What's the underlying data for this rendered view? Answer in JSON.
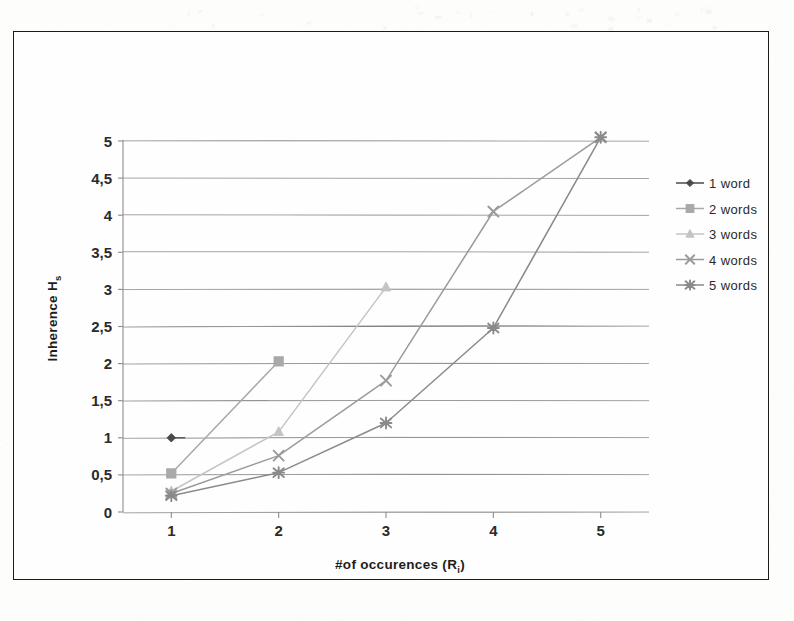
{
  "figure": {
    "frame_color": "#1a1a1a",
    "background": "#fefefe"
  },
  "chart_data": {
    "type": "line",
    "title": "",
    "subtitle": "",
    "xlabel": "#of occurences (R",
    "xlabel_sub": "i",
    "xlabel_suffix": ")",
    "ylabel": "Inherence H",
    "ylabel_sub": "s",
    "x": [
      1,
      2,
      3,
      4,
      5
    ],
    "xtick_labels": [
      "1",
      "2",
      "3",
      "4",
      "5"
    ],
    "ytick_labels": [
      "0",
      "0,5",
      "1",
      "1,5",
      "2",
      "2,5",
      "3",
      "3,5",
      "4",
      "4,5",
      "5"
    ],
    "ytick_values": [
      0,
      0.5,
      1,
      1.5,
      2,
      2.5,
      3,
      3.5,
      4,
      4.5,
      5
    ],
    "xlim": [
      0.55,
      5.45
    ],
    "ylim": [
      0,
      5
    ],
    "grid": true,
    "grid_axis": "y",
    "legend_position": "right",
    "decimal_separator": ",",
    "series": [
      {
        "name": "1 word",
        "marker": "diamond",
        "color": "#4a4a4a",
        "x": [
          1
        ],
        "values": [
          1.0
        ]
      },
      {
        "name": "2 words",
        "marker": "square",
        "color": "#a9a9a9",
        "x": [
          1,
          2
        ],
        "values": [
          0.52,
          2.03
        ]
      },
      {
        "name": "3 words",
        "marker": "triangle",
        "color": "#c4c4c4",
        "x": [
          1,
          2,
          3
        ],
        "values": [
          0.28,
          1.08,
          3.03
        ]
      },
      {
        "name": "4 words",
        "marker": "cross",
        "color": "#9b9b9b",
        "x": [
          1,
          2,
          3,
          4,
          5
        ],
        "values": [
          0.25,
          0.76,
          1.77,
          4.05,
          5.05
        ]
      },
      {
        "name": "5 words",
        "marker": "star",
        "color": "#8a8a8a",
        "x": [
          1,
          2,
          3,
          4,
          5
        ],
        "values": [
          0.22,
          0.53,
          1.2,
          2.48,
          5.05
        ]
      }
    ]
  }
}
